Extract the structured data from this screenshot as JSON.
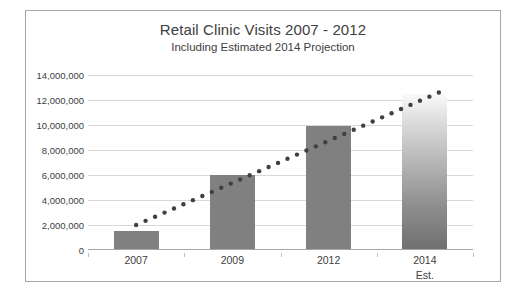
{
  "chart_data": {
    "type": "bar",
    "title": "Retail Clinic Visits 2007 - 2012",
    "subtitle": "Including Estimated 2014 Projection",
    "xlabel": "",
    "ylabel": "",
    "categories": [
      "2007",
      "2009",
      "2012",
      "2014"
    ],
    "category_sublabels": [
      "",
      "",
      "",
      "Est."
    ],
    "values": [
      1500000,
      6000000,
      9900000,
      12500000
    ],
    "bar_styles": [
      "solid",
      "solid",
      "solid",
      "gradient"
    ],
    "series": [
      {
        "name": "Retail Clinic Visits",
        "type": "bar",
        "values": [
          1500000,
          6000000,
          9900000,
          12500000
        ]
      },
      {
        "name": "Trendline",
        "type": "line",
        "style": "dotted",
        "values": [
          2000000,
          5500000,
          10100000,
          12600000
        ]
      }
    ],
    "ylim": [
      0,
      14000000
    ],
    "ytick_values": [
      0,
      2000000,
      4000000,
      6000000,
      8000000,
      10000000,
      12000000,
      14000000
    ],
    "ytick_labels": [
      "0",
      "2,000,000",
      "4,000,000",
      "6,000,000",
      "8,000,000",
      "10,000,000",
      "12,000,000",
      "14,000,000"
    ],
    "grid": true,
    "legend": false,
    "colors": {
      "bar": "#808080",
      "trendline": "#404040",
      "gridline": "#d9d9d9",
      "axis": "#a6a6a6",
      "text": "#404040",
      "border": "#a6a6a6",
      "background": "#ffffff"
    }
  }
}
